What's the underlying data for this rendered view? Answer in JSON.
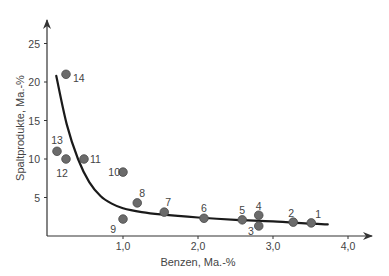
{
  "chart_data": {
    "type": "scatter",
    "title": "",
    "xlabel": "Benzen, Ma.-%",
    "ylabel": "Spaltprodukte, Ma.-%",
    "xlim": [
      0,
      4.3
    ],
    "ylim": [
      0,
      27
    ],
    "grid": false,
    "legend": null,
    "x_ticks": [
      {
        "value": 1.0,
        "label": "1,0"
      },
      {
        "value": 2.0,
        "label": "2,0"
      },
      {
        "value": 3.0,
        "label": "3,0"
      },
      {
        "value": 4.0,
        "label": "4,0"
      }
    ],
    "y_ticks": [
      {
        "value": 5,
        "label": "5"
      },
      {
        "value": 10,
        "label": "10"
      },
      {
        "value": 15,
        "label": "15"
      },
      {
        "value": 20,
        "label": "20"
      },
      {
        "value": 25,
        "label": "25"
      }
    ],
    "series": [
      {
        "name": "Messpunkte",
        "type": "scatter",
        "color": "#6b6b6b",
        "points": [
          {
            "label": "1",
            "x": 3.51,
            "y": 1.7
          },
          {
            "label": "2",
            "x": 3.27,
            "y": 1.8
          },
          {
            "label": "3",
            "x": 2.81,
            "y": 1.3
          },
          {
            "label": "4",
            "x": 2.81,
            "y": 2.7
          },
          {
            "label": "5",
            "x": 2.59,
            "y": 2.1
          },
          {
            "label": "6",
            "x": 2.08,
            "y": 2.3
          },
          {
            "label": "7",
            "x": 1.55,
            "y": 3.1
          },
          {
            "label": "8",
            "x": 1.19,
            "y": 4.3
          },
          {
            "label": "9",
            "x": 1.0,
            "y": 2.2
          },
          {
            "label": "10",
            "x": 1.0,
            "y": 8.3
          },
          {
            "label": "11",
            "x": 0.48,
            "y": 10.0
          },
          {
            "label": "12",
            "x": 0.24,
            "y": 10.0
          },
          {
            "label": "13",
            "x": 0.12,
            "y": 11.0
          },
          {
            "label": "14",
            "x": 0.24,
            "y": 21.0
          }
        ]
      },
      {
        "name": "Trendkurve",
        "type": "line",
        "color": "#1a1a1a",
        "points": [
          {
            "x": 0.11,
            "y": 20.8
          },
          {
            "x": 0.25,
            "y": 14.5
          },
          {
            "x": 0.4,
            "y": 10.0
          },
          {
            "x": 0.55,
            "y": 7.0
          },
          {
            "x": 0.7,
            "y": 5.2
          },
          {
            "x": 0.85,
            "y": 4.2
          },
          {
            "x": 1.0,
            "y": 3.6
          },
          {
            "x": 1.25,
            "y": 3.1
          },
          {
            "x": 1.5,
            "y": 2.8
          },
          {
            "x": 2.0,
            "y": 2.4
          },
          {
            "x": 2.5,
            "y": 2.1
          },
          {
            "x": 3.0,
            "y": 1.9
          },
          {
            "x": 3.5,
            "y": 1.6
          },
          {
            "x": 3.73,
            "y": 1.5
          }
        ]
      }
    ]
  }
}
